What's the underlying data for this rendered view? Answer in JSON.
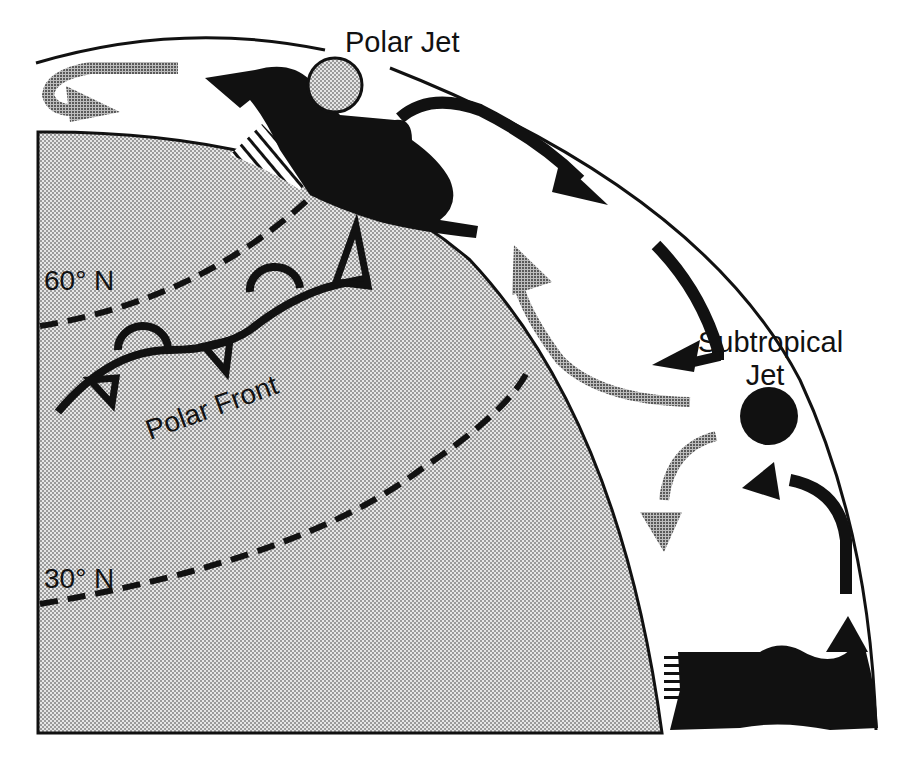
{
  "diagram": {
    "labels": {
      "polar_jet": "Polar Jet",
      "subtropical_jet_line1": "Subtropical",
      "subtropical_jet_line2": "Jet",
      "polar_front": "Polar Front",
      "lat_60": "60° N",
      "lat_30": "30° N"
    },
    "colors": {
      "ink": "#111111",
      "earth_fill": "#d4d4d4",
      "grey_arrow": "#8a8a8a",
      "background": "#ffffff"
    }
  }
}
